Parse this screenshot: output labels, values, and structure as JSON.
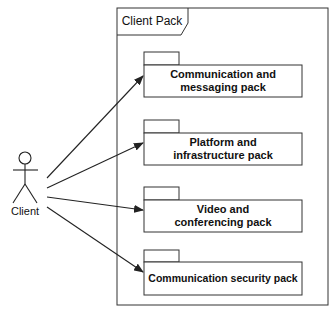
{
  "diagram": {
    "type": "uml-package-diagram",
    "actor": {
      "label": "Client"
    },
    "container": {
      "label": "Client Pack"
    },
    "packages": [
      {
        "label": "Communication and messaging pack"
      },
      {
        "label": "Platform and infrastructure pack"
      },
      {
        "label": "Video and conferencing pack"
      },
      {
        "label": "Communication security pack"
      }
    ],
    "edges": [
      {
        "from": "Client",
        "to": "Communication and messaging pack"
      },
      {
        "from": "Client",
        "to": "Platform and infrastructure pack"
      },
      {
        "from": "Client",
        "to": "Video and conferencing pack"
      },
      {
        "from": "Client",
        "to": "Communication security pack"
      }
    ],
    "colors": {
      "stroke": "#222222",
      "background": "#ffffff"
    }
  }
}
